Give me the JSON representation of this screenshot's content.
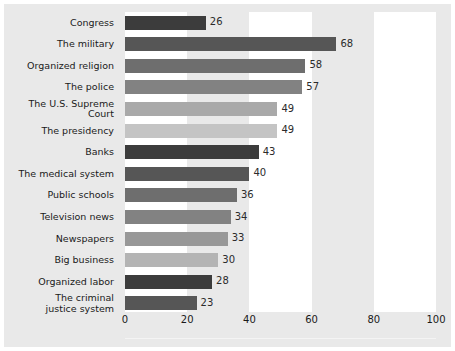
{
  "chart_data": {
    "type": "bar",
    "orientation": "horizontal",
    "title": "",
    "subtitle": "",
    "xlabel": "",
    "ylabel": "",
    "xlim": [
      0,
      100
    ],
    "xticks": [
      0,
      20,
      40,
      60,
      80,
      100
    ],
    "tick_labels": [
      "0",
      "20",
      "40",
      "60",
      "80",
      "100"
    ],
    "grid": false,
    "banded_background": true,
    "band_ranges": [
      [
        0,
        20
      ],
      [
        40,
        60
      ],
      [
        80,
        100
      ]
    ],
    "band_color": "#ffffff",
    "plot_background": "#e9e9e9",
    "categories": [
      "Congress",
      "The military",
      "Organized religion",
      "The police",
      "The U.S. Supreme Court",
      "The presidency",
      "Banks",
      "The medical system",
      "Public schools",
      "Television news",
      "Newspapers",
      "Big business",
      "Organized labor",
      "The criminal justice system"
    ],
    "values": [
      26,
      68,
      58,
      57,
      49,
      49,
      43,
      40,
      36,
      34,
      33,
      30,
      28,
      23
    ],
    "value_labels": [
      "26",
      "68",
      "58",
      "57",
      "49",
      "49",
      "43",
      "40",
      "36",
      "34",
      "33",
      "30",
      "28",
      "23"
    ],
    "bar_colors": [
      "#3c3c3c",
      "#565656",
      "#6e6e6e",
      "#828282",
      "#a9a9a9",
      "#c4c4c4",
      "#3c3c3c",
      "#565656",
      "#6e6e6e",
      "#828282",
      "#989898",
      "#b4b4b4",
      "#3c3c3c",
      "#565656"
    ],
    "bars": [
      {
        "label": "Congress",
        "value": 26,
        "value_label": "26",
        "color": "#3c3c3c",
        "label_lines": [
          "Congress"
        ]
      },
      {
        "label": "The military",
        "value": 68,
        "value_label": "68",
        "color": "#565656",
        "label_lines": [
          "The military"
        ]
      },
      {
        "label": "Organized religion",
        "value": 58,
        "value_label": "58",
        "color": "#6e6e6e",
        "label_lines": [
          "Organized religion"
        ]
      },
      {
        "label": "The police",
        "value": 57,
        "value_label": "57",
        "color": "#828282",
        "label_lines": [
          "The police"
        ]
      },
      {
        "label": "The U.S. Supreme Court",
        "value": 49,
        "value_label": "49",
        "color": "#a9a9a9",
        "label_lines": [
          "The U.S. Supreme Court"
        ]
      },
      {
        "label": "The presidency",
        "value": 49,
        "value_label": "49",
        "color": "#c4c4c4",
        "label_lines": [
          "The presidency"
        ]
      },
      {
        "label": "Banks",
        "value": 43,
        "value_label": "43",
        "color": "#3c3c3c",
        "label_lines": [
          "Banks"
        ]
      },
      {
        "label": "The medical system",
        "value": 40,
        "value_label": "40",
        "color": "#565656",
        "label_lines": [
          "The medical system"
        ]
      },
      {
        "label": "Public schools",
        "value": 36,
        "value_label": "36",
        "color": "#6e6e6e",
        "label_lines": [
          "Public schools"
        ]
      },
      {
        "label": "Television news",
        "value": 34,
        "value_label": "34",
        "color": "#828282",
        "label_lines": [
          "Television news"
        ]
      },
      {
        "label": "Newspapers",
        "value": 33,
        "value_label": "33",
        "color": "#989898",
        "label_lines": [
          "Newspapers"
        ]
      },
      {
        "label": "Big business",
        "value": 30,
        "value_label": "30",
        "color": "#b4b4b4",
        "label_lines": [
          "Big business"
        ]
      },
      {
        "label": "Organized labor",
        "value": 28,
        "value_label": "28",
        "color": "#3c3c3c",
        "label_lines": [
          "Organized labor"
        ]
      },
      {
        "label": "The criminal justice system",
        "value": 23,
        "value_label": "23",
        "color": "#565656",
        "label_lines": [
          "The criminal",
          "justice system"
        ]
      }
    ]
  }
}
